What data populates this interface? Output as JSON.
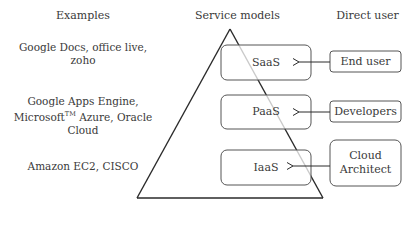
{
  "headers": {
    "examples": "Examples",
    "service_models": "Service models",
    "direct_user": "Direct user"
  },
  "examples": [
    {
      "line1": "Google Docs, office live,",
      "line2": "zoho"
    },
    {
      "line1": "Google Apps Engine,",
      "line2a": "Microsoft",
      "tm": "TM",
      "line2b": " Azure, Oracle",
      "line3": "Cloud"
    },
    {
      "line1": "Amazon EC2, CISCO"
    }
  ],
  "service_models": [
    {
      "label": "SaaS"
    },
    {
      "label": "PaaS"
    },
    {
      "label": "IaaS"
    }
  ],
  "direct_users": [
    {
      "label": "End user"
    },
    {
      "label": "Developers"
    },
    {
      "line1": "Cloud",
      "line2": "Architect"
    }
  ],
  "colors": {
    "line": "#2a2a2a",
    "box_border": "#555555",
    "text": "#3a3a3a",
    "triangle_inner": "#b0b0b0"
  }
}
